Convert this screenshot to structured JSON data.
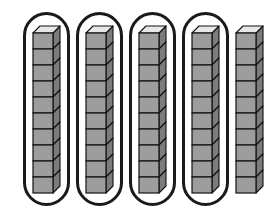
{
  "figure": {
    "description": "Five vertical rods of ten stacked unit cubes. Four rods are each circled with a rounded outline; the fifth rod on the right is not circled.",
    "background_color": "#ffffff"
  },
  "cube_style": {
    "front_fill": "#9d9d9d",
    "top_fill": "#e8e8e8",
    "side_fill": "#7c7c7c",
    "outline_color": "#111111"
  },
  "ring_style": {
    "stroke_color": "#1a1a1a",
    "stroke_width": "3",
    "corner_radius": "26"
  },
  "rods": [
    {
      "name": "rod-1",
      "cube_count": 10,
      "circled": true,
      "x": 23,
      "ring_x": 23,
      "ring_y": 12,
      "ring_width": 47,
      "ring_height": 194,
      "rod_x": 33,
      "rod_y": 26,
      "rod_width": 27
    },
    {
      "name": "rod-2",
      "cube_count": 10,
      "circled": true,
      "x": 76,
      "ring_x": 76,
      "ring_y": 12,
      "ring_width": 47,
      "ring_height": 194,
      "rod_x": 86,
      "rod_y": 26,
      "rod_width": 27
    },
    {
      "name": "rod-3",
      "cube_count": 10,
      "circled": true,
      "x": 129,
      "ring_x": 129,
      "ring_y": 12,
      "ring_width": 47,
      "ring_height": 194,
      "rod_x": 139,
      "rod_y": 26,
      "rod_width": 27
    },
    {
      "name": "rod-4",
      "cube_count": 10,
      "circled": true,
      "x": 182,
      "ring_x": 182,
      "ring_y": 12,
      "ring_width": 47,
      "ring_height": 194,
      "rod_x": 192,
      "rod_y": 26,
      "rod_width": 27
    },
    {
      "name": "rod-5",
      "cube_count": 10,
      "circled": false,
      "x": 232,
      "ring_x": 0,
      "ring_y": 0,
      "ring_width": 0,
      "ring_height": 0,
      "rod_x": 236,
      "rod_y": 26,
      "rod_width": 27
    }
  ],
  "totals": {
    "rod_count": 5,
    "cubes_per_rod": 10,
    "circled_rod_count": 4,
    "uncircled_rod_count": 1,
    "total_cubes": 50
  }
}
